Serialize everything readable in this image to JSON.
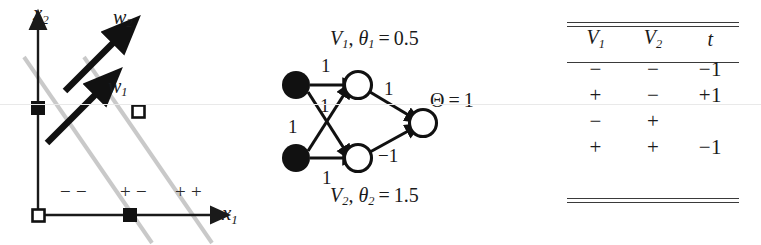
{
  "figure": {
    "background": "#ffffff",
    "scanline_color": "#e9e9e9"
  },
  "plot": {
    "axis_x_label": "x",
    "axis_x_sub": "1",
    "axis_y_label": "x",
    "axis_y_sub": "2",
    "vector_labels": [
      {
        "name": "w",
        "sub": "1"
      },
      {
        "name": "w",
        "sub": "2"
      }
    ],
    "region_labels": [
      {
        "text": "− −",
        "meaning": "minus-minus"
      },
      {
        "text": "+ −",
        "meaning": "plus-minus"
      },
      {
        "text": "+ +",
        "meaning": "plus-plus"
      }
    ],
    "points": [
      {
        "x": 0,
        "y": 1,
        "marker": "filled-square"
      },
      {
        "x": 1,
        "y": 1,
        "marker": "open-square"
      },
      {
        "x": 0,
        "y": 0,
        "marker": "open-square"
      },
      {
        "x": 1,
        "y": 0,
        "marker": "filled-square"
      }
    ],
    "decision_lines": 2,
    "decision_line_color": "#c9c9c9",
    "axis_color": "#1a1a1a",
    "vector_color": "#111111"
  },
  "network": {
    "top_hidden_label": {
      "unit": "V",
      "unit_sub": "1",
      "theta": "θ",
      "theta_sub": "1",
      "value": "0.5"
    },
    "bottom_hidden_label": {
      "unit": "V",
      "unit_sub": "2",
      "theta": "θ",
      "theta_sub": "2",
      "value": "1.5"
    },
    "output_label": {
      "symbol": "Θ",
      "value": "1"
    },
    "input_nodes": [
      {
        "id": "input-1",
        "fill": "filled"
      },
      {
        "id": "input-2",
        "fill": "filled"
      }
    ],
    "hidden_nodes": [
      {
        "id": "hidden-v1",
        "fill": "open"
      },
      {
        "id": "hidden-v2",
        "fill": "open"
      }
    ],
    "output_nodes": [
      {
        "id": "output",
        "fill": "open"
      }
    ],
    "edge_weights": [
      {
        "from": "input-1",
        "to": "hidden-v1",
        "weight": "1"
      },
      {
        "from": "input-2",
        "to": "hidden-v1",
        "weight": "1"
      },
      {
        "from": "input-1",
        "to": "hidden-v2",
        "weight": "1"
      },
      {
        "from": "input-2",
        "to": "hidden-v2",
        "weight": "1"
      },
      {
        "from": "hidden-v1",
        "to": "output",
        "weight": "1"
      },
      {
        "from": "hidden-v2",
        "to": "output",
        "weight": "−1"
      }
    ]
  },
  "table": {
    "headers": [
      {
        "label": "V",
        "sub": "1"
      },
      {
        "label": "V",
        "sub": "2"
      },
      {
        "label": "t",
        "sub": ""
      }
    ],
    "rows": [
      {
        "v1": "−",
        "v2": "−",
        "t": "−1"
      },
      {
        "v1": "+",
        "v2": "−",
        "t": "+1"
      },
      {
        "v1": "−",
        "v2": "+",
        "t": ""
      },
      {
        "v1": "+",
        "v2": "+",
        "t": "−1"
      }
    ],
    "rule_color": "#3a3a3a"
  }
}
